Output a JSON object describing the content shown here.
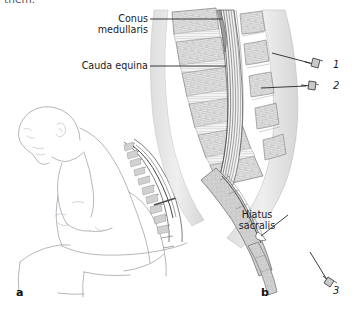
{
  "figure": {
    "cut_text": "them.",
    "background_color": "#ffffff",
    "ink_color": "#3d3d3d",
    "line_art_color": "#9aa0a6"
  },
  "labels": {
    "conus_medullaris": "Conus\nmedullaris",
    "conus_medullaris_line1": "Conus",
    "conus_medullaris_line2": "medullaris",
    "cauda_equina": "Cauda equina",
    "hiatus_sacralis_line1": "Hiatus",
    "hiatus_sacralis_line2": "sacralis"
  },
  "markers": [
    {
      "id": "1",
      "label": "1",
      "icon": "needle-icon",
      "description": "needle at upper lumbar level"
    },
    {
      "id": "2",
      "label": "2",
      "icon": "needle-icon",
      "description": "needle at lower lumbar level"
    },
    {
      "id": "3",
      "label": "3",
      "icon": "needle-icon",
      "description": "needle at sacral hiatus"
    }
  ],
  "panels": [
    {
      "id": "a",
      "letter": "a",
      "caption": "seated patient flexed forward with needle in lumbar region"
    },
    {
      "id": "b",
      "letter": "b",
      "caption": "sagittal section of lumbar spine, sacrum and coccyx"
    }
  ]
}
